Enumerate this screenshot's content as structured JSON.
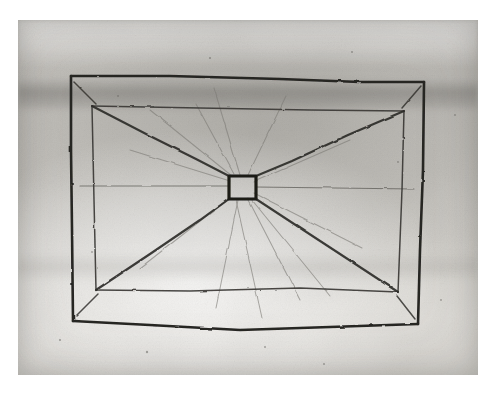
{
  "document": {
    "kind": "scanned-photograph-of-hand-drawing",
    "medium": "graphite / ink on paper",
    "subject": "perspective sketch of a rectangular vaulted ceiling seen from below, with diagonal ribs converging on a small central square opening",
    "alt_text": "Faded grey scan of a hand-drawn rectangle containing a second, inset rectangle; straight lines run from each corner toward a small dark square at the centre."
  },
  "colors": {
    "page_background": "#ffffff",
    "plate_background": "#c9c7c2",
    "paper_light": "#e2e0db",
    "paper_mid": "#cbc9c4",
    "paper_dark": "#b8b6b1",
    "ink_dark": "#23221f",
    "ink_mid": "#4a4845",
    "ink_faint": "#6e6c67",
    "ink_ghost": "#8b8984"
  },
  "plate": {
    "x": 18,
    "y": 20,
    "width": 460,
    "height": 355,
    "label": "photographic-plate"
  },
  "drawing": {
    "outer_rectangle": {
      "name": "outer-rectangle",
      "corners": {
        "top_left": [
          71,
          76
        ],
        "top_right": [
          424,
          82
        ],
        "bottom_right": [
          418,
          324
        ],
        "bottom_left": [
          73,
          321
        ]
      },
      "stroke": "#262522",
      "stroke_width": 2.6
    },
    "inner_rectangle": {
      "name": "inner-rectangle",
      "corners": {
        "top_left": [
          92,
          106
        ],
        "top_right": [
          404,
          111
        ],
        "bottom_right": [
          398,
          292
        ],
        "bottom_left": [
          96,
          290
        ]
      },
      "stroke": "#3a3936",
      "stroke_width": 1.5
    },
    "central_square": {
      "name": "central-square",
      "x": 229,
      "y": 176,
      "width": 27,
      "height": 23,
      "stroke": "#1c1b19",
      "stroke_width": 3.2
    },
    "diagonals": [
      {
        "name": "diagonal-top-left",
        "from": [
          92,
          106
        ],
        "to": [
          229,
          176
        ]
      },
      {
        "name": "diagonal-top-right",
        "from": [
          404,
          111
        ],
        "to": [
          256,
          176
        ]
      },
      {
        "name": "diagonal-bottom-right",
        "from": [
          398,
          292
        ],
        "to": [
          256,
          199
        ]
      },
      {
        "name": "diagonal-bottom-left",
        "from": [
          96,
          290
        ],
        "to": [
          229,
          199
        ]
      }
    ],
    "axis_lines": [
      {
        "name": "axis-horizontal-left",
        "from": [
          80,
          186
        ],
        "to": [
          229,
          186
        ]
      },
      {
        "name": "axis-horizontal-right",
        "from": [
          256,
          187
        ],
        "to": [
          414,
          189
        ]
      }
    ],
    "faint_rays": [
      {
        "name": "ray-1",
        "from": [
          232,
          176
        ],
        "to": [
          150,
          110
        ]
      },
      {
        "name": "ray-2",
        "from": [
          240,
          175
        ],
        "to": [
          214,
          88
        ]
      },
      {
        "name": "ray-3",
        "from": [
          248,
          175
        ],
        "to": [
          286,
          96
        ]
      },
      {
        "name": "ray-4",
        "from": [
          254,
          182
        ],
        "to": [
          350,
          140
        ]
      },
      {
        "name": "ray-5",
        "from": [
          254,
          193
        ],
        "to": [
          362,
          248
        ]
      },
      {
        "name": "ray-6",
        "from": [
          248,
          199
        ],
        "to": [
          300,
          300
        ]
      },
      {
        "name": "ray-7",
        "from": [
          238,
          200
        ],
        "to": [
          216,
          308
        ]
      },
      {
        "name": "ray-8",
        "from": [
          231,
          197
        ],
        "to": [
          140,
          268
        ]
      },
      {
        "name": "ray-9",
        "from": [
          230,
          181
        ],
        "to": [
          130,
          150
        ]
      }
    ],
    "corner_ticks": [
      {
        "name": "tick-top-left-inner",
        "from": [
          74,
          82
        ],
        "to": [
          96,
          104
        ]
      },
      {
        "name": "tick-top-right-inner",
        "from": [
          421,
          86
        ],
        "to": [
          402,
          108
        ]
      },
      {
        "name": "tick-bottom-left-inner",
        "from": [
          76,
          316
        ],
        "to": [
          98,
          294
        ]
      },
      {
        "name": "tick-bottom-right-inner",
        "from": [
          415,
          319
        ],
        "to": [
          397,
          296
        ]
      }
    ]
  },
  "annotations": {
    "specks": [
      {
        "x": 210,
        "y": 58
      },
      {
        "x": 352,
        "y": 52
      },
      {
        "x": 398,
        "y": 162
      },
      {
        "x": 147,
        "y": 352
      },
      {
        "x": 265,
        "y": 347
      },
      {
        "x": 60,
        "y": 340
      },
      {
        "x": 441,
        "y": 300
      },
      {
        "x": 92,
        "y": 252
      },
      {
        "x": 324,
        "y": 364
      }
    ]
  }
}
